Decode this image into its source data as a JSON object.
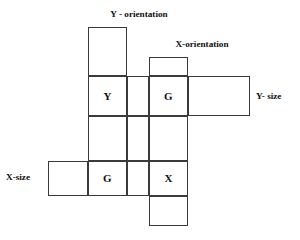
{
  "diagram": {
    "title_none": "",
    "labels": {
      "top_left": "Y - orientation",
      "top_right": "X-orientation",
      "right": "Y- size",
      "left": "X-size"
    },
    "colors": {
      "stroke": "#3a3a3a",
      "text": "#111111",
      "background": "#ffffff"
    },
    "cells": [
      {
        "id": "c-r1-col1",
        "text": "",
        "col": 1,
        "row": 1
      },
      {
        "id": "c-r1-col3",
        "text": "",
        "col": 3,
        "row": 1
      },
      {
        "id": "c-r2-col1",
        "text": "Y",
        "col": 1,
        "row": 2
      },
      {
        "id": "c-r2-col2",
        "text": "",
        "col": 2,
        "row": 2
      },
      {
        "id": "c-r2-col3",
        "text": "G",
        "col": 3,
        "row": 2
      },
      {
        "id": "c-r2-col4",
        "text": "",
        "col": 4,
        "row": 2
      },
      {
        "id": "c-r3-col1",
        "text": "",
        "col": 1,
        "row": 3
      },
      {
        "id": "c-r3-col2",
        "text": "",
        "col": 2,
        "row": 3
      },
      {
        "id": "c-r3-col3",
        "text": "",
        "col": 3,
        "row": 3
      },
      {
        "id": "c-r4-col0",
        "text": "",
        "col": 0,
        "row": 4
      },
      {
        "id": "c-r4-col1",
        "text": "G",
        "col": 1,
        "row": 4
      },
      {
        "id": "c-r4-col2",
        "text": "",
        "col": 2,
        "row": 4
      },
      {
        "id": "c-r4-col3",
        "text": "X",
        "col": 3,
        "row": 4
      },
      {
        "id": "c-r5-col3",
        "text": "",
        "col": 3,
        "row": 5
      }
    ]
  }
}
